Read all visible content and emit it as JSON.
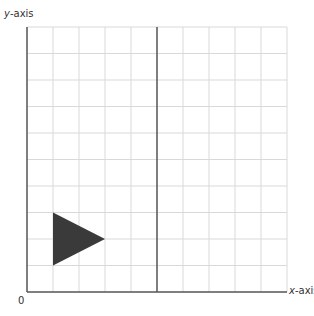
{
  "diagram": {
    "title": "",
    "y_axis_label": {
      "var": "y",
      "suffix": "-axis"
    },
    "x_axis_label": {
      "var": "x",
      "suffix": "-axis"
    },
    "origin_label": "0",
    "grid": {
      "columns": 10,
      "rows": 10,
      "left": 27,
      "top": 27,
      "right": 287,
      "bottom": 292,
      "grid_color": "#d9d9d9",
      "axis_color": "#555555",
      "center_line_column": 5
    },
    "shape": {
      "type": "triangle",
      "fill": "#3a3a3a",
      "grid_vertices": [
        [
          1,
          3
        ],
        [
          1,
          1
        ],
        [
          3,
          2
        ]
      ]
    }
  }
}
